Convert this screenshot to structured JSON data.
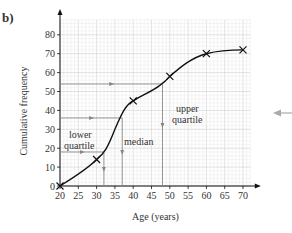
{
  "part_label": "b)",
  "chart_data": {
    "type": "line",
    "title": "",
    "xlabel": "Age (years)",
    "ylabel": "Cumulative frequency",
    "x_ticks": [
      20,
      25,
      30,
      35,
      40,
      45,
      50,
      55,
      60,
      65,
      70
    ],
    "y_ticks": [
      0,
      10,
      20,
      30,
      40,
      50,
      60,
      70,
      80
    ],
    "xlim": [
      20,
      72
    ],
    "ylim": [
      0,
      88
    ],
    "grid": true,
    "series": [
      {
        "name": "Cumulative frequency",
        "x": [
          20,
          30,
          40,
          50,
          60,
          70
        ],
        "y": [
          0,
          14,
          45,
          58,
          70,
          72
        ]
      }
    ],
    "annotations": [
      {
        "text": "lower quartile",
        "cf": 18,
        "age": 32
      },
      {
        "text": "median",
        "cf": 36,
        "age": 37
      },
      {
        "text": "upper quartile",
        "cf": 54,
        "age": 48
      }
    ]
  },
  "labels": {
    "lower1": "lower",
    "lower2": "quartile",
    "median": "median",
    "upper1": "upper",
    "upper2": "quartile"
  },
  "colors": {
    "curve": "#111111",
    "guide": "#888888",
    "grid": "#d8d8d8"
  }
}
